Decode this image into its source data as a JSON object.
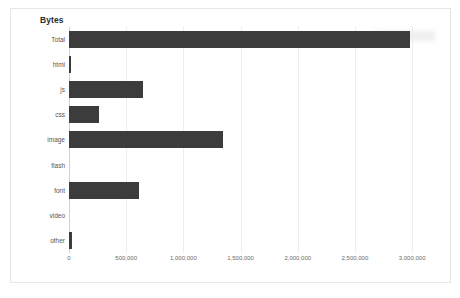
{
  "card": {
    "title": "Bytes"
  },
  "legend": {
    "entries": [
      {
        "swatch_color": "#3c3c3c",
        "label": "",
        "redacted": true
      }
    ]
  },
  "axis": {
    "tick_labels": [
      "0",
      "500,000",
      "1,000,000",
      "1,500,000",
      "2,000,000",
      "2,500,000",
      "3,000,000"
    ]
  },
  "chart_data": {
    "type": "bar",
    "orientation": "horizontal",
    "title": "Bytes",
    "xlabel": "",
    "ylabel": "",
    "categories": [
      "Total",
      "html",
      "js",
      "css",
      "image",
      "flash",
      "font",
      "video",
      "other"
    ],
    "values": [
      2984000,
      14000,
      648000,
      265000,
      1343000,
      0,
      610000,
      0,
      22000
    ],
    "series": [
      {
        "name": "Bytes",
        "color": "#3c3c3c",
        "values": [
          2984000,
          14000,
          648000,
          265000,
          1343000,
          0,
          610000,
          0,
          22000
        ]
      }
    ],
    "xlim": [
      0,
      3200000
    ],
    "xticks": [
      0,
      500000,
      1000000,
      1500000,
      2000000,
      2500000,
      3000000
    ],
    "xtick_labels": [
      "0",
      "500,000",
      "1,000,000",
      "1,500,000",
      "2,000,000",
      "2,500,000",
      "3,000,000"
    ],
    "grid": true,
    "grid_axis": "x",
    "legend_position": "top-right",
    "bar_color": "#3c3c3c"
  }
}
